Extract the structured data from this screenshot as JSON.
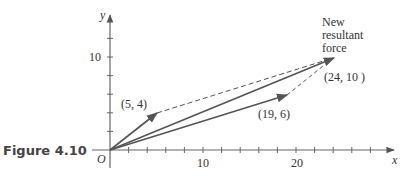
{
  "figure": {
    "caption": "Figure 4.10",
    "origin_label": "O",
    "x_axis": {
      "label": "x",
      "tick_labels": [
        "10",
        "20"
      ],
      "range": [
        0,
        28
      ],
      "tick_step": 2
    },
    "y_axis": {
      "label": "y",
      "tick_labels": [
        "10"
      ],
      "range": [
        0,
        14
      ],
      "tick_step": 2
    },
    "vectors": [
      {
        "name": "force-a",
        "from": [
          0,
          0
        ],
        "to": [
          5,
          4
        ],
        "label": "(5, 4)",
        "style": "solid-arrow"
      },
      {
        "name": "force-b",
        "from": [
          0,
          0
        ],
        "to": [
          19,
          6
        ],
        "label": "(19, 6)",
        "style": "solid-arrow"
      },
      {
        "name": "resultant",
        "from": [
          0,
          0
        ],
        "to": [
          24,
          10
        ],
        "label": "(24, 10 )",
        "style": "solid-arrow"
      }
    ],
    "dashed_lines": [
      {
        "from": [
          5,
          4
        ],
        "to": [
          24,
          10
        ]
      },
      {
        "from": [
          19,
          6
        ],
        "to": [
          24,
          10
        ]
      }
    ],
    "annotation": {
      "line1": "New",
      "line2": "resultant",
      "line3": "force"
    },
    "colors": {
      "axis": "#555555",
      "vector": "#555555",
      "text": "#333333"
    }
  }
}
